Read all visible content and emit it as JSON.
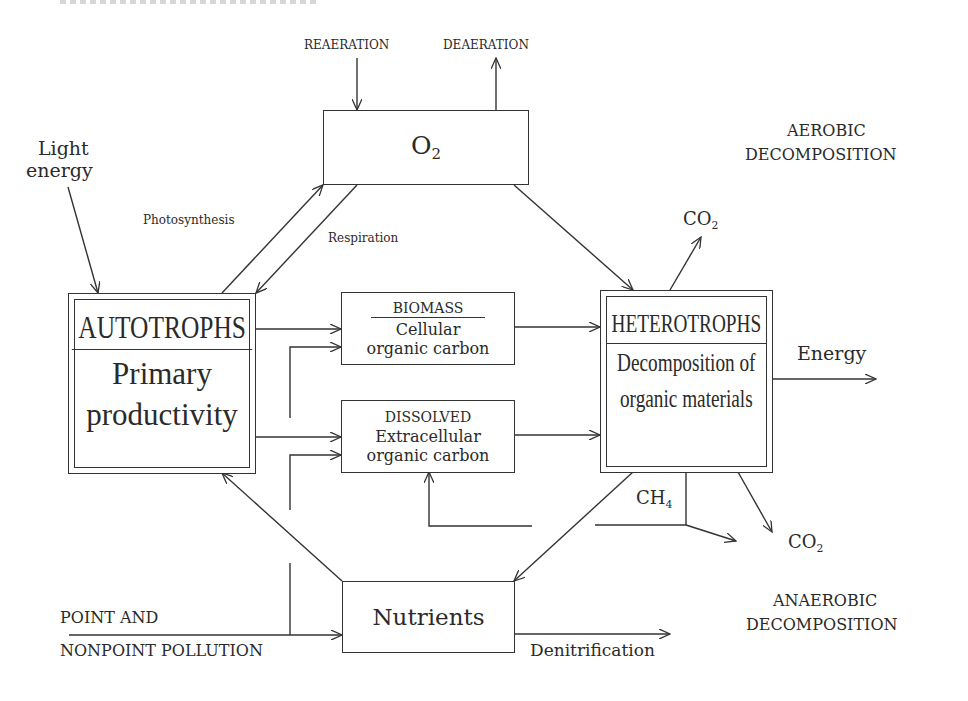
{
  "diagram": {
    "type": "flow-diagram",
    "top_fragment": "",
    "nodes": {
      "oxygen": {
        "label": "O",
        "subscript": "2"
      },
      "autotrophs": {
        "title": "AUTOTROPHS",
        "line1": "Primary",
        "line2": "productivity"
      },
      "biomass": {
        "title": "BIOMASS",
        "line1": "Cellular",
        "line2": "organic carbon"
      },
      "dissolved": {
        "title": "DISSOLVED",
        "line1": "Extracellular",
        "line2": "organic carbon"
      },
      "heterotrophs": {
        "title": "HETEROTROPHS",
        "line1": "Decomposition of",
        "line2": "organic materials"
      },
      "nutrients": {
        "label": "Nutrients"
      }
    },
    "labels": {
      "reaeration": "REAERATION",
      "deaeration": "DEAERATION",
      "light_energy_1": "Light",
      "light_energy_2": "energy",
      "photosynthesis": "Photosynthesis",
      "respiration": "Respiration",
      "aerobic_1": "AEROBIC",
      "aerobic_2": "DECOMPOSITION",
      "co2_top": "CO",
      "co2_top_sub": "2",
      "energy": "Energy",
      "ch4": "CH",
      "ch4_sub": "4",
      "co2_bottom": "CO",
      "co2_bottom_sub": "2",
      "anaerobic_1": "ANAEROBIC",
      "anaerobic_2": "DECOMPOSITION",
      "pollution_1": "POINT AND",
      "pollution_2": "NONPOINT POLLUTION",
      "denitrification": "Denitrification"
    },
    "edges": [
      {
        "from": "REAERATION",
        "to": "O2"
      },
      {
        "from": "O2",
        "to": "DEAERATION"
      },
      {
        "from": "Light energy",
        "to": "AUTOTROPHS"
      },
      {
        "from": "AUTOTROPHS",
        "to": "O2",
        "label": "Photosynthesis"
      },
      {
        "from": "O2",
        "to": "AUTOTROPHS",
        "label": "Respiration"
      },
      {
        "from": "O2",
        "to": "HETEROTROPHS"
      },
      {
        "from": "AUTOTROPHS",
        "to": "BIOMASS"
      },
      {
        "from": "AUTOTROPHS",
        "to": "DISSOLVED"
      },
      {
        "from": "POINT AND NONPOINT POLLUTION",
        "to": "BIOMASS"
      },
      {
        "from": "POINT AND NONPOINT POLLUTION",
        "to": "DISSOLVED"
      },
      {
        "from": "POINT AND NONPOINT POLLUTION",
        "to": "Nutrients"
      },
      {
        "from": "BIOMASS",
        "to": "HETEROTROPHS"
      },
      {
        "from": "DISSOLVED",
        "to": "HETEROTROPHS"
      },
      {
        "from": "HETEROTROPHS",
        "to": "CO2 (aerobic)"
      },
      {
        "from": "HETEROTROPHS",
        "to": "Energy"
      },
      {
        "from": "HETEROTROPHS",
        "to": "CH4"
      },
      {
        "from": "CH4",
        "to": "DISSOLVED"
      },
      {
        "from": "CH4",
        "to": "out"
      },
      {
        "from": "HETEROTROPHS",
        "to": "CO2 (anaerobic)"
      },
      {
        "from": "HETEROTROPHS",
        "to": "Nutrients"
      },
      {
        "from": "Nutrients",
        "to": "AUTOTROPHS"
      },
      {
        "from": "Nutrients",
        "to": "Denitrification"
      }
    ]
  }
}
